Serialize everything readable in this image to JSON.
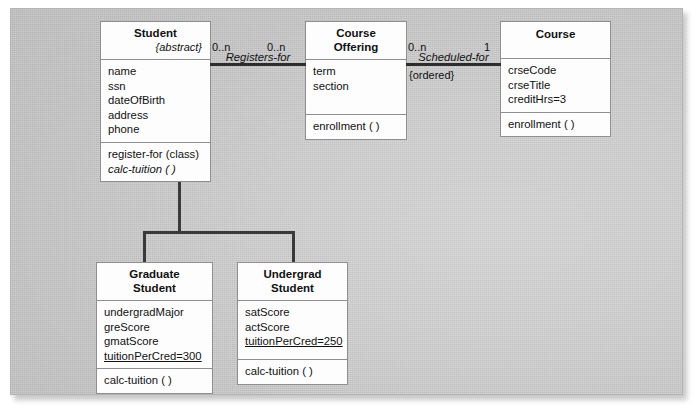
{
  "diagram": {
    "classes": {
      "student": {
        "name": "Student",
        "stereotype": "{abstract}",
        "attributes": [
          "name",
          "ssn",
          "dateOfBirth",
          "address",
          "phone"
        ],
        "operations": [
          "register-for (class)",
          "calc-tuition ( )"
        ]
      },
      "course_offering": {
        "name_line1": "Course",
        "name_line2": "Offering",
        "attributes": [
          "term",
          "section"
        ],
        "operations": [
          "enrollment ( )"
        ]
      },
      "course": {
        "name": "Course",
        "attributes": [
          "crseCode",
          "crseTitle",
          "creditHrs=3"
        ],
        "operations": [
          "enrollment ( )"
        ]
      },
      "graduate_student": {
        "name_line1": "Graduate",
        "name_line2": "Student",
        "attributes": [
          "undergradMajor",
          "greScore",
          "gmatScore",
          "tuitionPerCred=300"
        ],
        "operations": [
          "calc-tuition ( )"
        ]
      },
      "undergrad_student": {
        "name_line1": "Undergrad",
        "name_line2": "Student",
        "attributes": [
          "satScore",
          "actScore",
          "tuitionPerCred=250"
        ],
        "operations": [
          "calc-tuition ( )"
        ]
      }
    },
    "associations": {
      "registers_for": {
        "label": "Registers-for",
        "multiplicity_left": "0..n",
        "multiplicity_right": "0..n"
      },
      "scheduled_for": {
        "label": "Scheduled-for",
        "multiplicity_left": "0..n",
        "multiplicity_right": "1",
        "constraint": "{ordered}"
      }
    },
    "generalization": {
      "kind": "generalization-arrow",
      "parent": "Student",
      "children": [
        "Graduate Student",
        "Undergrad Student"
      ]
    },
    "colors": {
      "background": "#ffffff",
      "panel": "#cccccc",
      "box_fill": "#fdfdfd",
      "line": "#3a3a3a",
      "text": "#111111"
    }
  }
}
